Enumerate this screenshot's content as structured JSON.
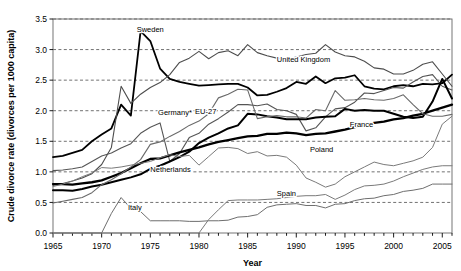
{
  "chart_data": {
    "type": "line",
    "title": "",
    "xlabel": "Year",
    "ylabel": "Crude divorce rate (divorces per 1000 capita)",
    "xlim": [
      1965,
      2006
    ],
    "ylim": [
      0.0,
      3.5
    ],
    "ytick_labels": [
      "0.0",
      "0.5",
      "1.0",
      "1.5",
      "2.0",
      "2.5",
      "3.0",
      "3.5"
    ],
    "ytick_values": [
      0.0,
      0.5,
      1.0,
      1.5,
      2.0,
      2.5,
      3.0,
      3.5
    ],
    "xtick_labels": [
      "1965",
      "1970",
      "1975",
      "1980",
      "1985",
      "1990",
      "1995",
      "2000",
      "2005"
    ],
    "xtick_values": [
      1965,
      1970,
      1975,
      1980,
      1985,
      1990,
      1995,
      2000,
      2005
    ],
    "grid": "horizontal-dashed",
    "legend": "inline-labels",
    "x": [
      1965,
      1966,
      1967,
      1968,
      1969,
      1970,
      1971,
      1972,
      1973,
      1974,
      1975,
      1976,
      1977,
      1978,
      1979,
      1980,
      1981,
      1982,
      1983,
      1984,
      1985,
      1986,
      1987,
      1988,
      1989,
      1990,
      1991,
      1992,
      1993,
      1994,
      1995,
      1996,
      1997,
      1998,
      1999,
      2000,
      2001,
      2002,
      2003,
      2004,
      2005,
      2006
    ],
    "series": [
      {
        "name": "Sweden",
        "label": "Sweden",
        "color": "#000000",
        "width": 1.8,
        "label_x": 1973.6,
        "label_y": 3.28,
        "values": [
          1.24,
          1.26,
          1.31,
          1.36,
          1.5,
          1.61,
          1.71,
          2.1,
          1.92,
          3.3,
          3.14,
          2.69,
          2.52,
          2.47,
          2.44,
          2.41,
          2.42,
          2.43,
          2.44,
          2.44,
          2.38,
          2.25,
          2.26,
          2.31,
          2.37,
          2.47,
          2.44,
          2.56,
          2.45,
          2.53,
          2.54,
          2.58,
          2.4,
          2.36,
          2.35,
          2.4,
          2.42,
          2.4,
          2.44,
          2.43,
          2.45,
          2.59
        ]
      },
      {
        "name": "United Kingdom",
        "label": "United Kingdom",
        "color": "#4d4d4d",
        "width": 1.1,
        "label_x": 1988.0,
        "label_y": 2.8,
        "values": [
          0.78,
          0.81,
          0.85,
          0.9,
          0.97,
          1.12,
          1.4,
          2.4,
          2.12,
          2.27,
          2.38,
          2.46,
          2.59,
          2.79,
          2.86,
          2.97,
          2.85,
          2.95,
          2.98,
          2.9,
          3.08,
          2.95,
          2.9,
          2.86,
          2.84,
          2.88,
          2.92,
          2.94,
          3.08,
          2.96,
          2.9,
          2.88,
          2.81,
          2.7,
          2.68,
          2.6,
          2.6,
          2.66,
          2.76,
          2.8,
          2.6,
          2.4
        ]
      },
      {
        "name": "Germany*",
        "label": "Germany*",
        "color": "#555555",
        "width": 1.1,
        "label_x": 1975.8,
        "label_y": 1.93,
        "values": [
          1.02,
          1.03,
          1.05,
          1.08,
          1.17,
          1.26,
          1.31,
          1.39,
          1.46,
          1.63,
          1.73,
          1.8,
          1.17,
          1.3,
          1.56,
          1.63,
          1.78,
          1.87,
          1.98,
          2.1,
          2.1,
          2.08,
          2.11,
          2.02,
          2.0,
          1.94,
          1.67,
          1.72,
          1.9,
          2.03,
          2.05,
          2.14,
          2.29,
          2.28,
          2.33,
          2.38,
          2.37,
          2.47,
          2.56,
          2.59,
          2.4,
          2.34
        ]
      },
      {
        "name": "EU-27",
        "label": "EU-27",
        "color": "#000000",
        "width": 2.3,
        "label_x": 1979.6,
        "label_y": 1.95,
        "values": [
          0.8,
          0.8,
          0.79,
          0.81,
          0.83,
          0.86,
          0.92,
          0.98,
          1.06,
          1.14,
          1.21,
          1.22,
          1.27,
          1.32,
          1.36,
          1.4,
          1.45,
          1.49,
          1.52,
          1.55,
          1.58,
          1.59,
          1.62,
          1.62,
          1.64,
          1.63,
          1.6,
          1.62,
          1.63,
          1.66,
          1.69,
          1.73,
          1.76,
          1.8,
          1.82,
          1.86,
          1.88,
          1.92,
          1.95,
          2.0,
          2.05,
          2.1
        ]
      },
      {
        "name": "France",
        "label": "France",
        "color": "#000000",
        "width": 2.0,
        "label_x": 1995.5,
        "label_y": 1.74,
        "values": [
          0.7,
          0.7,
          0.69,
          0.72,
          0.76,
          0.79,
          0.83,
          0.87,
          0.91,
          0.96,
          1.05,
          1.1,
          1.17,
          1.24,
          1.33,
          1.47,
          1.56,
          1.63,
          1.71,
          1.76,
          1.95,
          1.94,
          1.91,
          1.89,
          1.86,
          1.86,
          1.86,
          1.89,
          1.9,
          1.91,
          2.03,
          2.0,
          2.01,
          2.0,
          2.0,
          1.95,
          1.9,
          1.88,
          1.9,
          2.15,
          2.52,
          2.2
        ]
      },
      {
        "name": "Netherlands",
        "label": "Netherlands",
        "color": "#6a6a6a",
        "width": 1.1,
        "label_x": 1975.0,
        "label_y": 1.0,
        "values": [
          0.49,
          0.52,
          0.55,
          0.58,
          0.66,
          0.79,
          0.87,
          0.97,
          1.08,
          1.2,
          1.45,
          1.49,
          1.58,
          1.66,
          1.76,
          1.83,
          1.95,
          2.21,
          2.27,
          2.35,
          2.34,
          1.87,
          1.9,
          1.92,
          1.9,
          1.9,
          1.88,
          2.02,
          2.0,
          2.33,
          2.17,
          2.18,
          2.2,
          2.18,
          2.17,
          2.2,
          2.26,
          2.1,
          1.95,
          1.91,
          1.91,
          1.94
        ]
      },
      {
        "name": "Italy",
        "label": "Italy",
        "color": "#6e6e6e",
        "width": 1.0,
        "label_x": 1972.7,
        "label_y": 0.38,
        "values": [
          0.0,
          0.0,
          0.0,
          0.0,
          0.0,
          0.0,
          0.32,
          0.58,
          0.4,
          0.35,
          0.2,
          0.2,
          0.2,
          0.2,
          0.19,
          0.19,
          0.2,
          0.2,
          0.21,
          0.26,
          0.27,
          0.3,
          0.42,
          0.46,
          0.47,
          0.48,
          0.45,
          0.45,
          0.41,
          0.47,
          0.48,
          0.53,
          0.56,
          0.57,
          0.61,
          0.63,
          0.68,
          0.7,
          0.73,
          0.8,
          0.8,
          0.8
        ]
      },
      {
        "name": "Poland",
        "label": "Poland",
        "color": "#7a7a7a",
        "width": 1.0,
        "label_x": 1991.4,
        "label_y": 1.33,
        "values": [
          0.76,
          0.8,
          0.85,
          0.92,
          0.98,
          1.07,
          1.06,
          1.08,
          1.11,
          1.14,
          1.17,
          1.23,
          1.28,
          1.25,
          1.27,
          1.11,
          1.25,
          1.39,
          1.4,
          1.38,
          1.3,
          1.33,
          1.26,
          1.27,
          1.24,
          1.11,
          0.9,
          0.83,
          0.75,
          0.8,
          0.92,
          1.0,
          1.08,
          1.16,
          1.12,
          1.1,
          1.14,
          1.18,
          1.24,
          1.4,
          1.78,
          1.91
        ]
      },
      {
        "name": "Spain",
        "label": "Spain",
        "color": "#7a7a7a",
        "width": 1.0,
        "label_x": 1988.0,
        "label_y": 0.6,
        "values": [
          0.0,
          0.0,
          0.0,
          0.0,
          0.0,
          0.0,
          0.0,
          0.0,
          0.0,
          0.0,
          0.0,
          0.0,
          0.0,
          0.0,
          0.0,
          0.0,
          0.22,
          0.38,
          0.53,
          0.54,
          0.54,
          0.54,
          0.55,
          0.56,
          0.58,
          0.6,
          0.61,
          0.61,
          0.63,
          0.55,
          0.62,
          0.71,
          0.77,
          0.78,
          0.8,
          0.85,
          0.92,
          0.98,
          1.04,
          1.08,
          1.1,
          1.1
        ]
      }
    ]
  },
  "axis": {
    "ylabel": "Crude divorce rate (divorces per 1000 capita)",
    "xlabel": "Year"
  }
}
